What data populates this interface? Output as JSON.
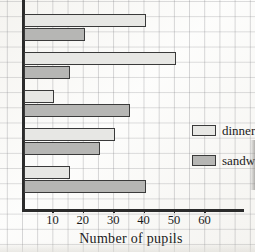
{
  "chart_data": {
    "type": "bar",
    "orientation": "horizontal",
    "title": "",
    "xlabel": "Number of pupils",
    "ylabel": "",
    "categories": [
      "M",
      "T",
      "W",
      "Th",
      "F"
    ],
    "category_full_names": [
      "Monday",
      "Tuesday",
      "Wednesday",
      "Thursday",
      "Friday"
    ],
    "series": [
      {
        "name": "dinners",
        "values": [
          40,
          50,
          10,
          30,
          15
        ],
        "color": "#e7e7e4"
      },
      {
        "name": "sandwiches",
        "values": [
          20,
          15,
          35,
          25,
          40
        ],
        "color": "#b6b6b4"
      }
    ],
    "xlim": [
      0,
      70
    ],
    "x_ticks": [
      10,
      20,
      30,
      40,
      50,
      60
    ],
    "x_tick_labels": [
      "10",
      "20",
      "30",
      "40",
      "50",
      "60"
    ],
    "minor_gridline_step": 5,
    "grid": true,
    "legend_position": "right-middle"
  },
  "legend": {
    "entries": [
      {
        "label": "dinners"
      },
      {
        "label": "sandwich"
      }
    ]
  },
  "axis": {
    "x_title": "Number of pupils"
  }
}
